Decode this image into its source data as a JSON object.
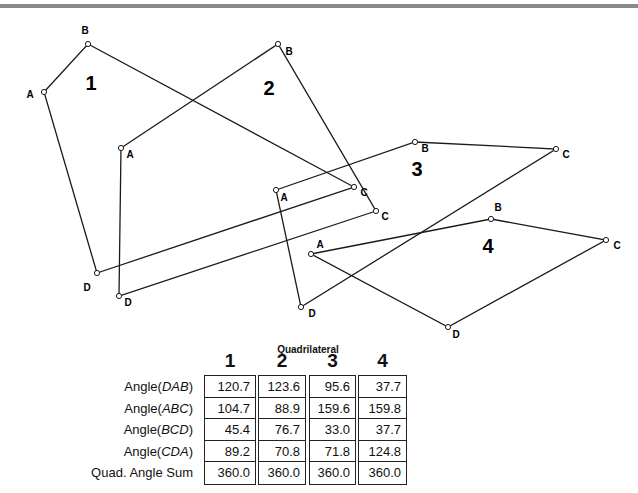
{
  "diagram": {
    "quadrilaterals": [
      {
        "id": "1",
        "label": "1",
        "label_pos": [
          91,
          90
        ],
        "vertices": {
          "A": [
            44,
            92
          ],
          "B": [
            88,
            44
          ],
          "C": [
            354,
            187
          ],
          "D": [
            97,
            273
          ]
        },
        "vertex_labels": {
          "A": [
            30,
            98
          ],
          "B": [
            85,
            34
          ],
          "C": [
            364,
            196
          ],
          "D": [
            87,
            291
          ]
        }
      },
      {
        "id": "2",
        "label": "2",
        "label_pos": [
          269,
          95
        ],
        "vertices": {
          "A": [
            121,
            148
          ],
          "B": [
            278,
            44
          ],
          "C": [
            376,
            211
          ],
          "D": [
            119,
            296
          ]
        },
        "vertex_labels": {
          "A": [
            130,
            158
          ],
          "B": [
            289,
            55
          ],
          "C": [
            385,
            220
          ],
          "D": [
            128,
            306
          ]
        }
      },
      {
        "id": "3",
        "label": "3",
        "label_pos": [
          417,
          176
        ],
        "vertices": {
          "A": [
            276,
            190
          ],
          "B": [
            415,
            142
          ],
          "C": [
            556,
            149
          ],
          "D": [
            301,
            307
          ]
        },
        "vertex_labels": {
          "A": [
            284,
            201
          ],
          "B": [
            425,
            152
          ],
          "C": [
            566,
            158
          ],
          "D": [
            312,
            317
          ]
        }
      },
      {
        "id": "4",
        "label": "4",
        "label_pos": [
          488,
          253
        ],
        "vertices": {
          "A": [
            311,
            254
          ],
          "B": [
            491,
            219
          ],
          "C": [
            606,
            240
          ],
          "D": [
            448,
            327
          ]
        },
        "vertex_labels": {
          "A": [
            320,
            248
          ],
          "B": [
            498,
            211
          ],
          "C": [
            617,
            249
          ],
          "D": [
            456,
            338
          ]
        }
      }
    ]
  },
  "table": {
    "title": "Quadrilateral",
    "columns": [
      "1",
      "2",
      "3",
      "4"
    ],
    "row_labels": [
      {
        "prefix": "Angle(",
        "italic": "DAB",
        "suffix": ")"
      },
      {
        "prefix": "Angle(",
        "italic": "ABC",
        "suffix": ")"
      },
      {
        "prefix": "Angle(",
        "italic": "BCD",
        "suffix": ")"
      },
      {
        "prefix": "Angle(",
        "italic": "CDA",
        "suffix": ")"
      },
      {
        "prefix": "Quad. Angle Sum",
        "italic": "",
        "suffix": ""
      }
    ],
    "values": [
      [
        "120.7",
        "104.7",
        "45.4",
        "89.2",
        "360.0"
      ],
      [
        "123.6",
        "88.9",
        "76.7",
        "70.8",
        "360.0"
      ],
      [
        "95.6",
        "159.6",
        "33.0",
        "71.8",
        "360.0"
      ],
      [
        "37.7",
        "159.8",
        "37.7",
        "124.8",
        "360.0"
      ]
    ]
  }
}
